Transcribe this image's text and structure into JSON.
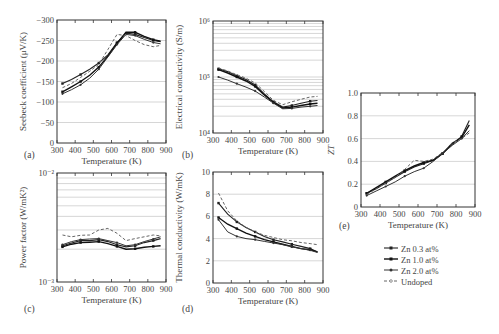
{
  "figure": {
    "xlabel": "Temperature (K)",
    "legend": [
      "Zn 0.3 at%",
      "Zn 1.0 at%",
      "Zn 2.0 at%",
      "Undoped"
    ]
  },
  "chart_data": [
    {
      "id": "a",
      "panel_label": "(a)",
      "type": "line",
      "xlabel": "Temperature (K)",
      "ylabel": "Seebeck coefficient (μV/K)",
      "xlim": [
        300,
        900
      ],
      "ylim": [
        0,
        -300
      ],
      "xticks": [
        300,
        400,
        500,
        600,
        700,
        800,
        900
      ],
      "yticks": [
        0,
        -50,
        -100,
        -150,
        -200,
        -250,
        -300
      ],
      "ytick_labels": [
        "0",
        "−50",
        "−100",
        "−150",
        "−200",
        "−250",
        "−300"
      ],
      "grid": true,
      "x": [
        330,
        380,
        430,
        480,
        530,
        580,
        630,
        680,
        730,
        780,
        830,
        870
      ],
      "series": [
        {
          "name": "Zn 0.3 at%",
          "values": [
            -145,
            -155,
            -167,
            -180,
            -195,
            -215,
            -245,
            -268,
            -265,
            -257,
            -250,
            -247
          ]
        },
        {
          "name": "Zn 1.0 at%",
          "values": [
            -125,
            -137,
            -150,
            -165,
            -185,
            -212,
            -243,
            -270,
            -270,
            -260,
            -252,
            -248
          ]
        },
        {
          "name": "Zn 2.0 at%",
          "values": [
            -120,
            -130,
            -142,
            -158,
            -180,
            -210,
            -240,
            -265,
            -262,
            -253,
            -245,
            -242
          ]
        },
        {
          "name": "Undoped",
          "values": [
            -135,
            -145,
            -160,
            -175,
            -192,
            -228,
            -265,
            -262,
            -250,
            -240,
            -235,
            -238
          ]
        }
      ]
    },
    {
      "id": "b",
      "panel_label": "(b)",
      "type": "line",
      "xlabel": "Temperature (K)",
      "ylabel": "Electrical conductivity (S/m)",
      "yscale": "log",
      "xlim": [
        300,
        900
      ],
      "ylim": [
        10000,
        1000000
      ],
      "xticks": [
        300,
        400,
        500,
        600,
        700,
        800,
        900
      ],
      "ytick_labels": [
        "10⁴",
        "10⁵",
        "10⁶"
      ],
      "grid": true,
      "x": [
        330,
        380,
        430,
        480,
        530,
        580,
        630,
        680,
        730,
        780,
        830,
        870
      ],
      "series": [
        {
          "name": "Zn 0.3 at%",
          "values": [
            140000,
            125000,
            105000,
            90000,
            72000,
            50000,
            36000,
            29000,
            31000,
            34000,
            37000,
            38000
          ]
        },
        {
          "name": "Zn 1.0 at%",
          "values": [
            135000,
            118000,
            100000,
            85000,
            68000,
            48000,
            35000,
            28000,
            29000,
            31000,
            33000,
            34000
          ]
        },
        {
          "name": "Zn 2.0 at%",
          "values": [
            100000,
            88000,
            76000,
            66000,
            56000,
            44000,
            34000,
            27000,
            27500,
            29000,
            30000,
            31000
          ]
        },
        {
          "name": "Undoped",
          "values": [
            145000,
            128000,
            110000,
            95000,
            78000,
            55000,
            38000,
            32000,
            36000,
            40000,
            44000,
            45000
          ]
        }
      ]
    },
    {
      "id": "c",
      "panel_label": "(c)",
      "type": "line",
      "xlabel": "Temperature (K)",
      "ylabel": "Power factor (W/mK²)",
      "yscale": "log",
      "xlim": [
        300,
        900
      ],
      "ylim": [
        0.001,
        0.01
      ],
      "xticks": [
        300,
        400,
        500,
        600,
        700,
        800,
        900
      ],
      "ytick_labels": [
        "10⁻³",
        "10⁻²"
      ],
      "grid": true,
      "x": [
        330,
        380,
        430,
        480,
        530,
        580,
        630,
        680,
        730,
        780,
        830,
        870
      ],
      "series": [
        {
          "name": "Zn 0.3 at%",
          "values": [
            0.00215,
            0.00228,
            0.0024,
            0.0024,
            0.00245,
            0.00235,
            0.0022,
            0.0021,
            0.00215,
            0.0023,
            0.0024,
            0.0025
          ]
        },
        {
          "name": "Zn 1.0 at%",
          "values": [
            0.0021,
            0.00222,
            0.0023,
            0.00232,
            0.00235,
            0.00225,
            0.00212,
            0.002,
            0.00202,
            0.00208,
            0.00212,
            0.00215
          ]
        },
        {
          "name": "Zn 2.0 at%",
          "values": [
            0.0022,
            0.00235,
            0.00245,
            0.00248,
            0.0025,
            0.0024,
            0.0023,
            0.00215,
            0.0022,
            0.00235,
            0.00248,
            0.0026
          ]
        },
        {
          "name": "Undoped",
          "values": [
            0.0027,
            0.0026,
            0.00268,
            0.0027,
            0.003,
            0.0031,
            0.0028,
            0.0024,
            0.0025,
            0.0026,
            0.0027,
            0.00265
          ]
        }
      ]
    },
    {
      "id": "d",
      "panel_label": "(d)",
      "type": "line",
      "xlabel": "Temperature (K)",
      "ylabel": "Thermal conductivity (W/mK)",
      "xlim": [
        300,
        900
      ],
      "ylim": [
        0,
        10
      ],
      "xticks": [
        300,
        400,
        500,
        600,
        700,
        800,
        900
      ],
      "yticks": [
        0,
        2,
        4,
        6,
        8,
        10
      ],
      "grid": true,
      "x": [
        330,
        380,
        430,
        480,
        530,
        580,
        630,
        680,
        730,
        780,
        830,
        870
      ],
      "series": [
        {
          "name": "Zn 0.3 at%",
          "values": [
            7.2,
            6.2,
            5.5,
            5.0,
            4.6,
            4.2,
            3.9,
            3.7,
            3.5,
            3.3,
            3.1,
            2.8
          ]
        },
        {
          "name": "Zn 1.0 at%",
          "values": [
            5.9,
            5.3,
            4.9,
            4.5,
            4.2,
            3.9,
            3.7,
            3.5,
            3.3,
            3.1,
            3.0,
            2.8
          ]
        },
        {
          "name": "Zn 2.0 at%",
          "values": [
            5.7,
            4.6,
            4.2,
            4.0,
            3.9,
            3.75,
            3.6,
            3.45,
            3.25,
            3.1,
            2.95,
            2.75
          ]
        },
        {
          "name": "Undoped",
          "values": [
            8.1,
            6.5,
            5.6,
            5.0,
            4.6,
            4.3,
            4.1,
            3.9,
            3.8,
            3.65,
            3.55,
            3.45
          ]
        }
      ]
    },
    {
      "id": "e",
      "panel_label": "(e)",
      "type": "line",
      "xlabel": "Temperature (K)",
      "ylabel": "ZT",
      "xlim": [
        300,
        900
      ],
      "ylim": [
        0,
        1.0
      ],
      "xticks": [
        300,
        400,
        500,
        600,
        700,
        800,
        900
      ],
      "yticks": [
        0,
        0.2,
        0.4,
        0.6,
        0.8,
        1.0
      ],
      "ytick_labels": [
        "0",
        "0.2",
        "0.4",
        "0.6",
        "0.8",
        "1.0"
      ],
      "grid": true,
      "x": [
        330,
        380,
        430,
        480,
        530,
        580,
        630,
        680,
        730,
        780,
        830,
        870
      ],
      "series": [
        {
          "name": "Zn 0.3 at%",
          "values": [
            0.12,
            0.16,
            0.21,
            0.26,
            0.31,
            0.35,
            0.38,
            0.41,
            0.47,
            0.55,
            0.62,
            0.76
          ]
        },
        {
          "name": "Zn 1.0 at%",
          "values": [
            0.12,
            0.17,
            0.22,
            0.27,
            0.32,
            0.36,
            0.39,
            0.41,
            0.47,
            0.56,
            0.61,
            0.72
          ]
        },
        {
          "name": "Zn 2.0 at%",
          "values": [
            0.1,
            0.14,
            0.18,
            0.22,
            0.27,
            0.31,
            0.34,
            0.4,
            0.47,
            0.54,
            0.6,
            0.67
          ]
        },
        {
          "name": "Undoped",
          "values": [
            0.11,
            0.16,
            0.21,
            0.26,
            0.33,
            0.41,
            0.4,
            0.42,
            0.48,
            0.56,
            0.6,
            0.65
          ]
        }
      ]
    }
  ]
}
